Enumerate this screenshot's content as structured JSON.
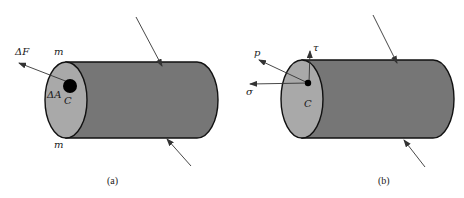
{
  "colors": {
    "body_fill": "#767676",
    "face_fill": "#a9a9a9",
    "outline": "#111111",
    "arrow": "#333333",
    "background": "#ffffff"
  },
  "panels": [
    {
      "id": "a",
      "caption": "(a)",
      "labels": {
        "force": "ΔF",
        "section_top": "m",
        "section_bottom": "m",
        "area": "ΔA",
        "point": "C"
      },
      "elements": [
        "cylinder",
        "cross-section face",
        "area element dot",
        "force vector ΔF",
        "applied load arrow top",
        "applied load arrow bottom"
      ]
    },
    {
      "id": "b",
      "caption": "(b)",
      "labels": {
        "total_stress": "p",
        "shear_stress": "τ",
        "normal_stress": "σ",
        "point": "C"
      },
      "elements": [
        "cylinder",
        "cross-section face",
        "point dot",
        "stress vector p",
        "shear stress τ",
        "normal stress σ",
        "applied load arrow top",
        "applied load arrow bottom"
      ]
    }
  ]
}
